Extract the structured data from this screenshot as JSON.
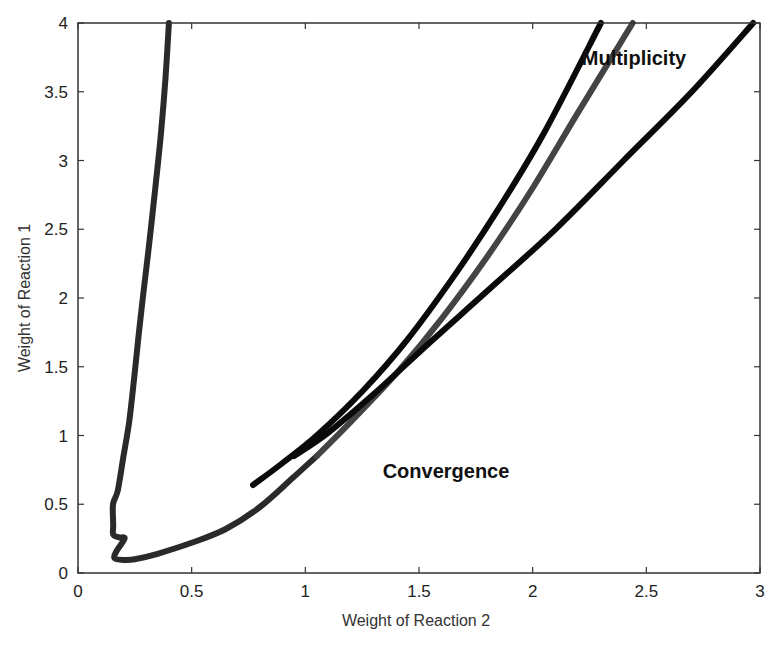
{
  "chart_data": {
    "type": "line",
    "title": "",
    "xlabel": "Weight of Reaction 2",
    "ylabel": "Weight of Reaction 1",
    "xlim": [
      0,
      3
    ],
    "ylim": [
      0,
      4
    ],
    "xticks": [
      0,
      0.5,
      1,
      1.5,
      2,
      2.5,
      3
    ],
    "yticks": [
      0,
      0.5,
      1,
      1.5,
      2,
      2.5,
      3,
      3.5,
      4
    ],
    "xtick_labels": [
      "0",
      "0.5",
      "1",
      "1.5",
      "2",
      "2.5",
      "3"
    ],
    "ytick_labels": [
      "0",
      "0.5",
      "1",
      "1.5",
      "2",
      "2.5",
      "3",
      "3.5",
      "4"
    ],
    "grid": false,
    "legend": null,
    "annotations": [
      {
        "text": "Multiplicity",
        "x": 2.72,
        "y": 3.72
      },
      {
        "text": "Convergence",
        "x": 1.42,
        "y": 0.75
      }
    ],
    "series": [
      {
        "name": "left boundary (continuing into lower branch)",
        "color": "#2a2a2a",
        "points": [
          [
            0.4,
            4.0
          ],
          [
            0.385,
            3.6
          ],
          [
            0.365,
            3.2
          ],
          [
            0.34,
            2.8
          ],
          [
            0.31,
            2.35
          ],
          [
            0.285,
            2.0
          ],
          [
            0.265,
            1.7
          ],
          [
            0.246,
            1.4
          ],
          [
            0.225,
            1.1
          ],
          [
            0.2,
            0.85
          ],
          [
            0.175,
            0.6
          ],
          [
            0.154,
            0.5
          ],
          [
            0.155,
            0.35
          ],
          [
            0.155,
            0.28
          ],
          [
            0.18,
            0.26
          ],
          [
            0.205,
            0.25
          ],
          [
            0.17,
            0.16
          ],
          [
            0.16,
            0.11
          ],
          [
            0.2,
            0.095
          ],
          [
            0.25,
            0.1
          ],
          [
            0.35,
            0.14
          ],
          [
            0.5,
            0.22
          ],
          [
            0.65,
            0.32
          ],
          [
            0.8,
            0.48
          ],
          [
            0.95,
            0.7
          ],
          [
            1.05,
            0.85
          ]
        ]
      },
      {
        "name": "middle curve (gray)",
        "color": "#444444",
        "points": [
          [
            1.05,
            0.85
          ],
          [
            1.2,
            1.1
          ],
          [
            1.4,
            1.45
          ],
          [
            1.6,
            1.85
          ],
          [
            1.8,
            2.3
          ],
          [
            2.0,
            2.8
          ],
          [
            2.2,
            3.35
          ],
          [
            2.44,
            4.0
          ]
        ]
      },
      {
        "name": "upper-left black curve",
        "color": "#0a0a0a",
        "points": [
          [
            0.77,
            0.64
          ],
          [
            0.9,
            0.8
          ],
          [
            1.05,
            1.0
          ],
          [
            1.25,
            1.32
          ],
          [
            1.45,
            1.7
          ],
          [
            1.65,
            2.15
          ],
          [
            1.85,
            2.65
          ],
          [
            2.05,
            3.2
          ],
          [
            2.3,
            4.0
          ]
        ]
      },
      {
        "name": "rightmost black curve",
        "color": "#0a0a0a",
        "points": [
          [
            0.95,
            0.85
          ],
          [
            1.1,
            1.02
          ],
          [
            1.3,
            1.3
          ],
          [
            1.55,
            1.68
          ],
          [
            1.8,
            2.05
          ],
          [
            2.1,
            2.5
          ],
          [
            2.4,
            3.0
          ],
          [
            2.7,
            3.5
          ],
          [
            2.97,
            4.0
          ]
        ]
      }
    ]
  }
}
